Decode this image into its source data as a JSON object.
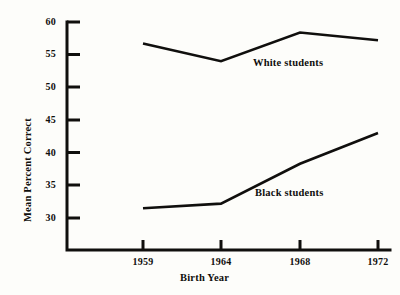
{
  "chart_data": {
    "type": "line",
    "title": "",
    "xlabel": "Birth Year",
    "ylabel": "Mean Percent Correct",
    "categories": [
      "1959",
      "1964",
      "1968",
      "1972"
    ],
    "x": [
      1959,
      1964,
      1968,
      1972
    ],
    "xlim": [
      1957.5,
      1973.5
    ],
    "ylim": [
      28,
      60
    ],
    "ytick_labels": [
      "30",
      "35",
      "40",
      "45",
      "50",
      "55",
      "60"
    ],
    "yticks": [
      30,
      35,
      40,
      45,
      50,
      55,
      60
    ],
    "grid": false,
    "legend_position": "inline-annotation",
    "series": [
      {
        "name": "White students",
        "values": [
          56.7,
          54.0,
          58.4,
          57.2
        ],
        "color": "#100f0d"
      },
      {
        "name": "Black students",
        "values": [
          31.5,
          32.2,
          38.3,
          43.0
        ],
        "color": "#100f0d"
      }
    ],
    "annotations": [
      {
        "text": "White students",
        "series": "White students"
      },
      {
        "text": "Black students",
        "series": "Black students"
      }
    ]
  },
  "axis": {
    "line_color": "#100f0d",
    "background": "#fdfdfa"
  }
}
